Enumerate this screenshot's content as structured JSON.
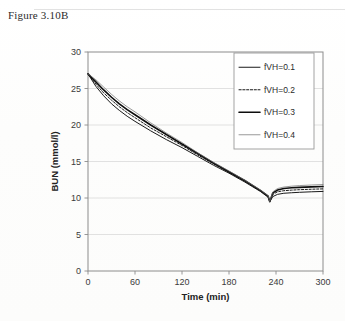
{
  "caption": "Figure 3.10B",
  "colors": {
    "axis": "#8c8c8c",
    "grid": "#d9d9d9",
    "curve": "#1a1a1a",
    "curve_light": "#6f6f6f",
    "text": "#2b2b2b",
    "background": "#ffffff",
    "legend_border": "#9a9a9a"
  },
  "legend": {
    "position": "top-right",
    "items": [
      {
        "label": "fVH=0.1",
        "style": "solid",
        "width": 1.0,
        "color": "#1a1a1a"
      },
      {
        "label": "fVH=0.2",
        "style": "dashed",
        "width": 1.0,
        "color": "#1a1a1a"
      },
      {
        "label": "fVH=0.3",
        "style": "solid",
        "width": 1.6,
        "color": "#0d0d0d"
      },
      {
        "label": "fVH=0.4",
        "style": "solid",
        "width": 0.7,
        "color": "#6f6f6f"
      }
    ]
  },
  "chart_data": {
    "type": "line",
    "title": "",
    "xlabel": "Time (min)",
    "ylabel": "BUN (mmol/l)",
    "xlim": [
      0,
      300
    ],
    "ylim": [
      0,
      30
    ],
    "xticks": [
      0,
      60,
      120,
      180,
      240,
      300
    ],
    "yticks": [
      0,
      5,
      10,
      15,
      20,
      25,
      30
    ],
    "grid": "horizontal",
    "legend_entries": [
      "fVH=0.1",
      "fVH=0.2",
      "fVH=0.3",
      "fVH=0.4"
    ],
    "x": [
      0,
      10,
      20,
      30,
      40,
      50,
      60,
      80,
      100,
      120,
      140,
      160,
      180,
      200,
      220,
      230,
      232,
      236,
      242,
      250,
      260,
      270,
      285,
      300
    ],
    "series": [
      {
        "name": "fVH=0.1",
        "values": [
          27.0,
          25.3,
          24.0,
          22.9,
          22.0,
          21.2,
          20.5,
          19.2,
          18.0,
          16.9,
          15.7,
          14.5,
          13.4,
          12.2,
          10.9,
          10.1,
          9.5,
          10.2,
          10.5,
          10.65,
          10.72,
          10.78,
          10.85,
          10.9
        ]
      },
      {
        "name": "fVH=0.2",
        "values": [
          27.0,
          25.6,
          24.4,
          23.4,
          22.5,
          21.7,
          21.0,
          19.6,
          18.4,
          17.2,
          15.9,
          14.7,
          13.5,
          12.3,
          11.0,
          10.2,
          9.5,
          10.5,
          10.85,
          11.0,
          11.08,
          11.14,
          11.2,
          11.25
        ]
      },
      {
        "name": "fVH=0.3",
        "values": [
          27.0,
          25.9,
          24.8,
          23.8,
          22.9,
          22.1,
          21.4,
          20.0,
          18.7,
          17.4,
          16.1,
          14.8,
          13.6,
          12.4,
          11.05,
          10.25,
          9.5,
          10.7,
          11.1,
          11.3,
          11.4,
          11.46,
          11.52,
          11.58
        ]
      },
      {
        "name": "fVH=0.4",
        "values": [
          27.0,
          26.2,
          25.2,
          24.2,
          23.3,
          22.5,
          21.8,
          20.3,
          18.9,
          17.6,
          16.2,
          14.9,
          13.7,
          12.45,
          11.1,
          10.3,
          9.5,
          10.85,
          11.3,
          11.5,
          11.62,
          11.7,
          11.78,
          11.85
        ]
      }
    ]
  }
}
